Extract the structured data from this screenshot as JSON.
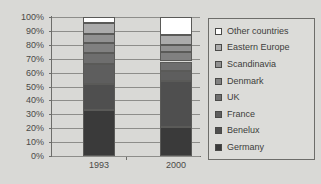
{
  "chart_data": {
    "type": "bar",
    "subtype": "stacked-percent",
    "title": "",
    "xlabel": "",
    "ylabel": "",
    "categories": [
      "1993",
      "2000"
    ],
    "ylim": [
      0,
      100
    ],
    "ytick_labels": [
      "0%",
      "10%",
      "20%",
      "30%",
      "40%",
      "50%",
      "60%",
      "70%",
      "80%",
      "90%",
      "100%"
    ],
    "ytick_values": [
      0,
      10,
      20,
      30,
      40,
      50,
      60,
      70,
      80,
      90,
      100
    ],
    "grid": true,
    "legend_position": "right",
    "series": [
      {
        "name": "Germany",
        "color": "#3a3a3a",
        "values": [
          33,
          21
        ]
      },
      {
        "name": "Benelux",
        "color": "#4f4f4f",
        "values": [
          19,
          33
        ]
      },
      {
        "name": "France",
        "color": "#5e5e5e",
        "values": [
          14,
          7
        ]
      },
      {
        "name": "UK",
        "color": "#6e6e6e",
        "values": [
          8,
          7
        ]
      },
      {
        "name": "Denmark",
        "color": "#808080",
        "values": [
          7,
          7
        ]
      },
      {
        "name": "Scandinavia",
        "color": "#919191",
        "values": [
          7,
          5
        ]
      },
      {
        "name": "Eastern Europe",
        "color": "#ababab",
        "values": [
          8,
          7
        ]
      },
      {
        "name": "Other countries",
        "color": "#ffffff",
        "values": [
          4,
          13
        ]
      }
    ]
  },
  "legend": {
    "items": [
      {
        "label": "Other countries",
        "color": "#ffffff"
      },
      {
        "label": "Eastern Europe",
        "color": "#ababab"
      },
      {
        "label": "Scandinavia",
        "color": "#919191"
      },
      {
        "label": "Denmark",
        "color": "#808080"
      },
      {
        "label": "UK",
        "color": "#6e6e6e"
      },
      {
        "label": "France",
        "color": "#5e5e5e"
      },
      {
        "label": "Benelux",
        "color": "#4f4f4f"
      },
      {
        "label": "Germany",
        "color": "#3a3a3a"
      }
    ]
  },
  "colors": {
    "background": "#d9d9d6",
    "axis": "#6d6d6a",
    "gridline": "#8d8d8a",
    "text": "#4a4a48"
  }
}
